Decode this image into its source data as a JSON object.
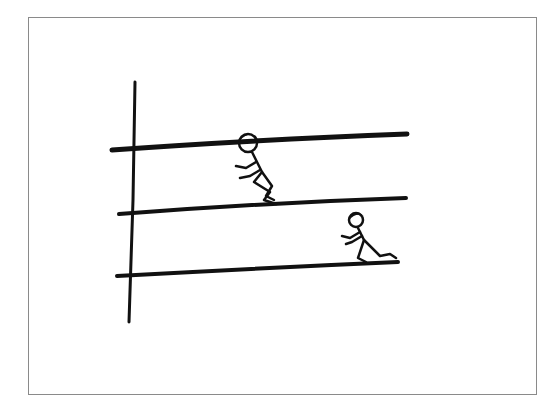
{
  "illustration": {
    "description": "Hand-drawn sketch: vertical pole with three horizontal bars; one stick figure crouching between the top and middle bars, another crawling on the bottom bar",
    "colors": {
      "ink": "#111111",
      "frame": "#8a8a8a",
      "background": "#ffffff"
    },
    "bars": [
      {
        "name": "top",
        "x1": 112,
        "y1": 150,
        "x2": 407,
        "y2": 134
      },
      {
        "name": "middle",
        "x1": 119,
        "y1": 214,
        "x2": 406,
        "y2": 198
      },
      {
        "name": "bottom",
        "x1": 117,
        "y1": 276,
        "x2": 398,
        "y2": 262
      }
    ],
    "figures": [
      {
        "name": "crouching-figure",
        "pose": "crouching"
      },
      {
        "name": "crawling-figure",
        "pose": "crawling"
      }
    ]
  }
}
